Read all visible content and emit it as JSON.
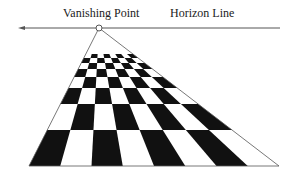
{
  "labels": {
    "vanishing_point": "Vanishing Point",
    "horizon_line": "Horizon Line"
  },
  "geometry": {
    "horizon_y": 28,
    "horizon_x1": 18,
    "horizon_x2": 280,
    "vp": [
      99,
      28
    ],
    "bottom_y": 166,
    "bottom_left": 29,
    "bottom_right": 279,
    "top_y": 54,
    "columns": 8,
    "row_ys": [
      54,
      58,
      63,
      69,
      77,
      88,
      104,
      130,
      166
    ]
  },
  "colors": {
    "ink": "#111111",
    "line": "#555555",
    "background": "#ffffff"
  }
}
